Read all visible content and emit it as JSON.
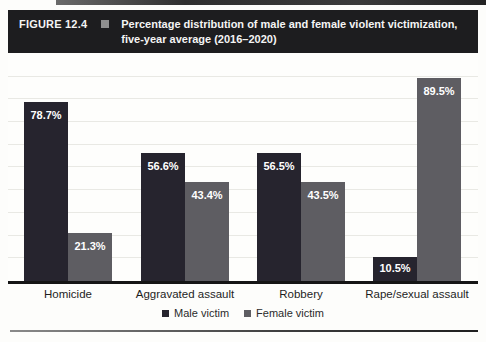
{
  "header": {
    "figure_label": "FIGURE 12.4",
    "title_line1": "Percentage distribution of male and female violent victimization,",
    "title_line2": "five-year average (2016–2020)"
  },
  "chart_data": {
    "type": "bar",
    "title": "Percentage distribution of male and female violent victimization, five-year average (2016–2020)",
    "categories": [
      "Homicide",
      "Aggravated assault",
      "Robbery",
      "Rape/sexual assault"
    ],
    "series": [
      {
        "name": "Male victim",
        "color": "#26242e",
        "values": [
          78.7,
          56.6,
          56.5,
          10.5
        ],
        "labels": [
          "78.7%",
          "56.6%",
          "56.5%",
          "10.5%"
        ]
      },
      {
        "name": "Female victim",
        "color": "#5e5d62",
        "values": [
          21.3,
          43.4,
          43.5,
          89.5
        ],
        "labels": [
          "21.3%",
          "43.4%",
          "43.5%",
          "89.5%"
        ]
      }
    ],
    "ylim": [
      0,
      100
    ],
    "grid": "horizontal gridlines every 10%, unlabeled axis",
    "legend_position": "bottom",
    "value_label_color": "#ffffff"
  },
  "colors": {
    "header_bg": "#1d1d1f",
    "header_text": "#f4f4f4",
    "figure_marker": "#8f8f8f",
    "axis": "#151515",
    "gridline": "#e9e9e4",
    "page_bg": "#fdfdfb"
  }
}
